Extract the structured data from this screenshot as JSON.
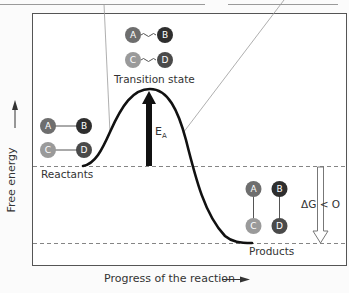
{
  "diagram": {
    "type": "reaction-energy-profile",
    "y_axis_label": "Free energy",
    "x_axis_label": "Progress of the reaction",
    "states": {
      "reactants": {
        "label": "Reactants",
        "molecules": [
          {
            "left": "A",
            "right": "B",
            "bond": "single"
          },
          {
            "left": "C",
            "right": "D",
            "bond": "single"
          }
        ]
      },
      "transition": {
        "label": "Transition state",
        "molecules": [
          {
            "left": "A",
            "right": "B",
            "bond": "partial-wavy"
          },
          {
            "left": "C",
            "right": "D",
            "bond": "partial-wavy"
          }
        ]
      },
      "products": {
        "label": "Products",
        "molecules": [
          {
            "top": "A",
            "bottom": "C",
            "bond": "single"
          },
          {
            "top": "B",
            "bottom": "D",
            "bond": "single"
          }
        ]
      }
    },
    "activation_energy": {
      "label": "E",
      "subscript": "A"
    },
    "delta_g": {
      "label": "ΔG < O"
    },
    "atoms": {
      "A": {
        "letter": "A",
        "color": "#6e6e6e"
      },
      "B": {
        "letter": "B",
        "color": "#2e2e2e"
      },
      "C": {
        "letter": "C",
        "color": "#9a9a9a"
      },
      "D": {
        "letter": "D",
        "color": "#4a4a4a"
      }
    }
  }
}
